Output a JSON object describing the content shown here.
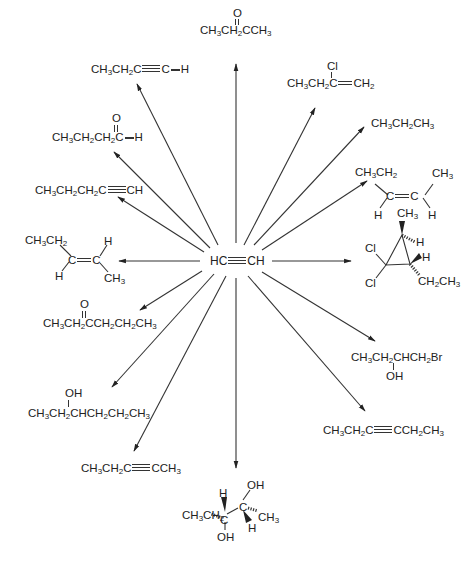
{
  "diagram": {
    "type": "reaction-scheme",
    "center": {
      "label": "HC≡CH",
      "name": "acetylene"
    },
    "products": [
      {
        "id": "butanone",
        "direction": "up",
        "formula": "CH3CH2CCH3",
        "substituent_above": "O (C=O)"
      },
      {
        "id": "1-butyne-H",
        "direction": "up-left",
        "formula": "CH3CH2C≡C—H"
      },
      {
        "id": "2-chloro-1-butene",
        "direction": "up-right",
        "formula": "CH3CH2C=CH2",
        "substituent_above": "Cl"
      },
      {
        "id": "butanal",
        "direction": "left-up",
        "formula": "CH3CH2CH2C—H",
        "substituent_above": "O (C=O)"
      },
      {
        "id": "propane",
        "direction": "right-up",
        "formula": "CH3CH2CH3"
      },
      {
        "id": "1-pentyne",
        "direction": "left-up-low",
        "formula": "CH3CH2CH2C≡CH"
      },
      {
        "id": "cis-2-pentene",
        "direction": "right-up-low",
        "formula": "CH3CH2(H)C=C(H)CH3",
        "labels": [
          "CH3CH2",
          "C=C",
          "CH3",
          "H",
          "H"
        ]
      },
      {
        "id": "trans-2-pentene",
        "direction": "left",
        "formula": "CH3CH2(H)C=C(H)CH3",
        "labels": [
          "CH3CH2",
          "C=C",
          "H",
          "H",
          "CH3"
        ]
      },
      {
        "id": "dichlorocyclopropane",
        "direction": "right",
        "labels": [
          "CH3",
          "H",
          "H",
          "Cl",
          "Cl",
          "CH2CH3"
        ]
      },
      {
        "id": "3-hexanone",
        "direction": "left-down",
        "formula": "CH3CH2CCH2CH2CH3",
        "substituent_above": "O (C=O)"
      },
      {
        "id": "bromohydrin",
        "direction": "right-down",
        "formula": "CH3CH2CHCH2Br",
        "substituent_below": "OH"
      },
      {
        "id": "3-hexanol",
        "direction": "left-down-low",
        "formula": "CH3CH2CHCH2CH2CH3",
        "substituent_above": "OH"
      },
      {
        "id": "3-hexyne",
        "direction": "right-down-low",
        "formula": "CH3CH2C≡CCH2CH3"
      },
      {
        "id": "2-pentyne",
        "direction": "down-left",
        "formula": "CH3CH2C≡CCH3"
      },
      {
        "id": "diol",
        "direction": "down",
        "labels": [
          "H",
          "OH",
          "CH3CH2",
          "C",
          "C",
          "CH3",
          "OH",
          "H"
        ]
      }
    ],
    "text": {
      "center": [
        "HC",
        "CH"
      ],
      "butanone": [
        "O",
        "CH",
        "3",
        "CH",
        "2",
        "CCH",
        "3"
      ],
      "butyne": [
        "CH",
        "3",
        "CH",
        "2",
        "C",
        "C",
        "H"
      ],
      "chlorobutene": [
        "Cl",
        "CH",
        "3",
        "CH",
        "2",
        "C",
        "CH",
        "2"
      ],
      "butanal": [
        "O",
        "CH",
        "3",
        "CH",
        "2",
        "CH",
        "2",
        "C",
        "H"
      ],
      "propane": [
        "CH",
        "3",
        "CH",
        "2",
        "CH",
        "3"
      ],
      "pentyne1": [
        "CH",
        "3",
        "CH",
        "2",
        "CH",
        "2",
        "C",
        "CH"
      ],
      "cis": [
        "CH",
        "3",
        "CH",
        "2",
        "C",
        "C",
        "CH",
        "3",
        "H",
        "H"
      ],
      "trans": [
        "CH",
        "3",
        "CH",
        "2",
        "H",
        "C",
        "C",
        "H",
        "CH",
        "3"
      ],
      "cyclo": [
        "CH",
        "3",
        "H",
        "H",
        "Cl",
        "Cl",
        "CH",
        "2",
        "CH",
        "3"
      ],
      "hexanone": [
        "O",
        "CH",
        "3",
        "CH",
        "2",
        "CCH",
        "2",
        "CH",
        "2",
        "CH",
        "3"
      ],
      "bromo": [
        "CH",
        "3",
        "CH",
        "2",
        "CHCH",
        "2",
        "Br",
        "OH"
      ],
      "hexanol": [
        "OH",
        "CH",
        "3",
        "CH",
        "2",
        "CHCH",
        "2",
        "CH",
        "2",
        "CH",
        "3"
      ],
      "hexyne": [
        "CH",
        "3",
        "CH",
        "2",
        "C",
        "CCH",
        "2",
        "CH",
        "3"
      ],
      "pentyne2": [
        "CH",
        "3",
        "CH",
        "2",
        "C",
        "CCH",
        "3"
      ],
      "diol": [
        "H",
        "OH",
        "CH",
        "3",
        "CH",
        "2",
        "C",
        "C",
        "CH",
        "3",
        "OH",
        "H"
      ]
    },
    "colors": {
      "ink": "#222222",
      "background": "#ffffff"
    }
  }
}
